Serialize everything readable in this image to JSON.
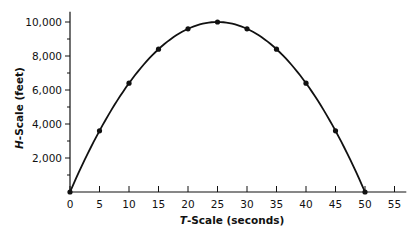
{
  "chart_data": {
    "type": "line",
    "title": "",
    "xlabel": "T-Scale (seconds)",
    "ylabel": "H-Scale (feet)",
    "x_ticks": [
      "0",
      "5",
      "10",
      "15",
      "20",
      "25",
      "30",
      "35",
      "40",
      "45",
      "50",
      "55"
    ],
    "y_ticks": [
      "2,000",
      "4,000",
      "6,000",
      "8,000",
      "10,000"
    ],
    "xlim": [
      0,
      55
    ],
    "ylim": [
      0,
      10000
    ],
    "grid": false,
    "legend": null,
    "series": [
      {
        "name": "H vs T",
        "x": [
          0,
          5,
          10,
          15,
          20,
          25,
          30,
          35,
          40,
          45,
          50
        ],
        "y": [
          0,
          3600,
          6400,
          8400,
          9600,
          10000,
          9600,
          8400,
          6400,
          3600,
          0
        ],
        "markers": true,
        "curve": "smooth parabola"
      }
    ]
  },
  "labels": {
    "x_axis_prefix": "T",
    "x_axis_rest": "-Scale (seconds)",
    "y_axis_prefix": "H",
    "y_axis_rest": "-Scale (feet)"
  }
}
